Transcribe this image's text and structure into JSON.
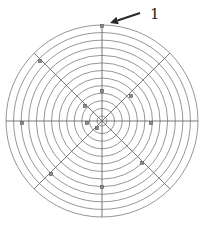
{
  "diagram": {
    "title": "",
    "center": {
      "x": 102,
      "y": 121
    },
    "outer_radius": 96,
    "ring_count": 13,
    "inner_radius": 5,
    "axes": [
      {
        "name": "vertical",
        "angle": 90
      },
      {
        "name": "horizontal",
        "angle": 0
      },
      {
        "name": "diagonal-ne-sw",
        "angle": 45
      },
      {
        "name": "diagonal-nw-se",
        "angle": 135
      }
    ],
    "markers": [
      {
        "x": 102,
        "y": 26
      },
      {
        "x": 40,
        "y": 61
      },
      {
        "x": 102,
        "y": 91
      },
      {
        "x": 85,
        "y": 106
      },
      {
        "x": 131,
        "y": 96
      },
      {
        "x": 22,
        "y": 123
      },
      {
        "x": 87,
        "y": 123
      },
      {
        "x": 151,
        "y": 123
      },
      {
        "x": 97,
        "y": 128
      },
      {
        "x": 142,
        "y": 163
      },
      {
        "x": 51,
        "y": 174
      },
      {
        "x": 102,
        "y": 187
      }
    ],
    "callout": {
      "label": "1",
      "arrow_from": {
        "x": 140,
        "y": 13
      },
      "arrow_to": {
        "x": 110,
        "y": 23
      },
      "label_pos": {
        "x": 150,
        "y": 19
      }
    },
    "colors": {
      "ring": "#8a8a8a",
      "axis": "#6a6a6a",
      "marker": "#8c8c8c",
      "arrow": "#2a2a2a"
    }
  }
}
